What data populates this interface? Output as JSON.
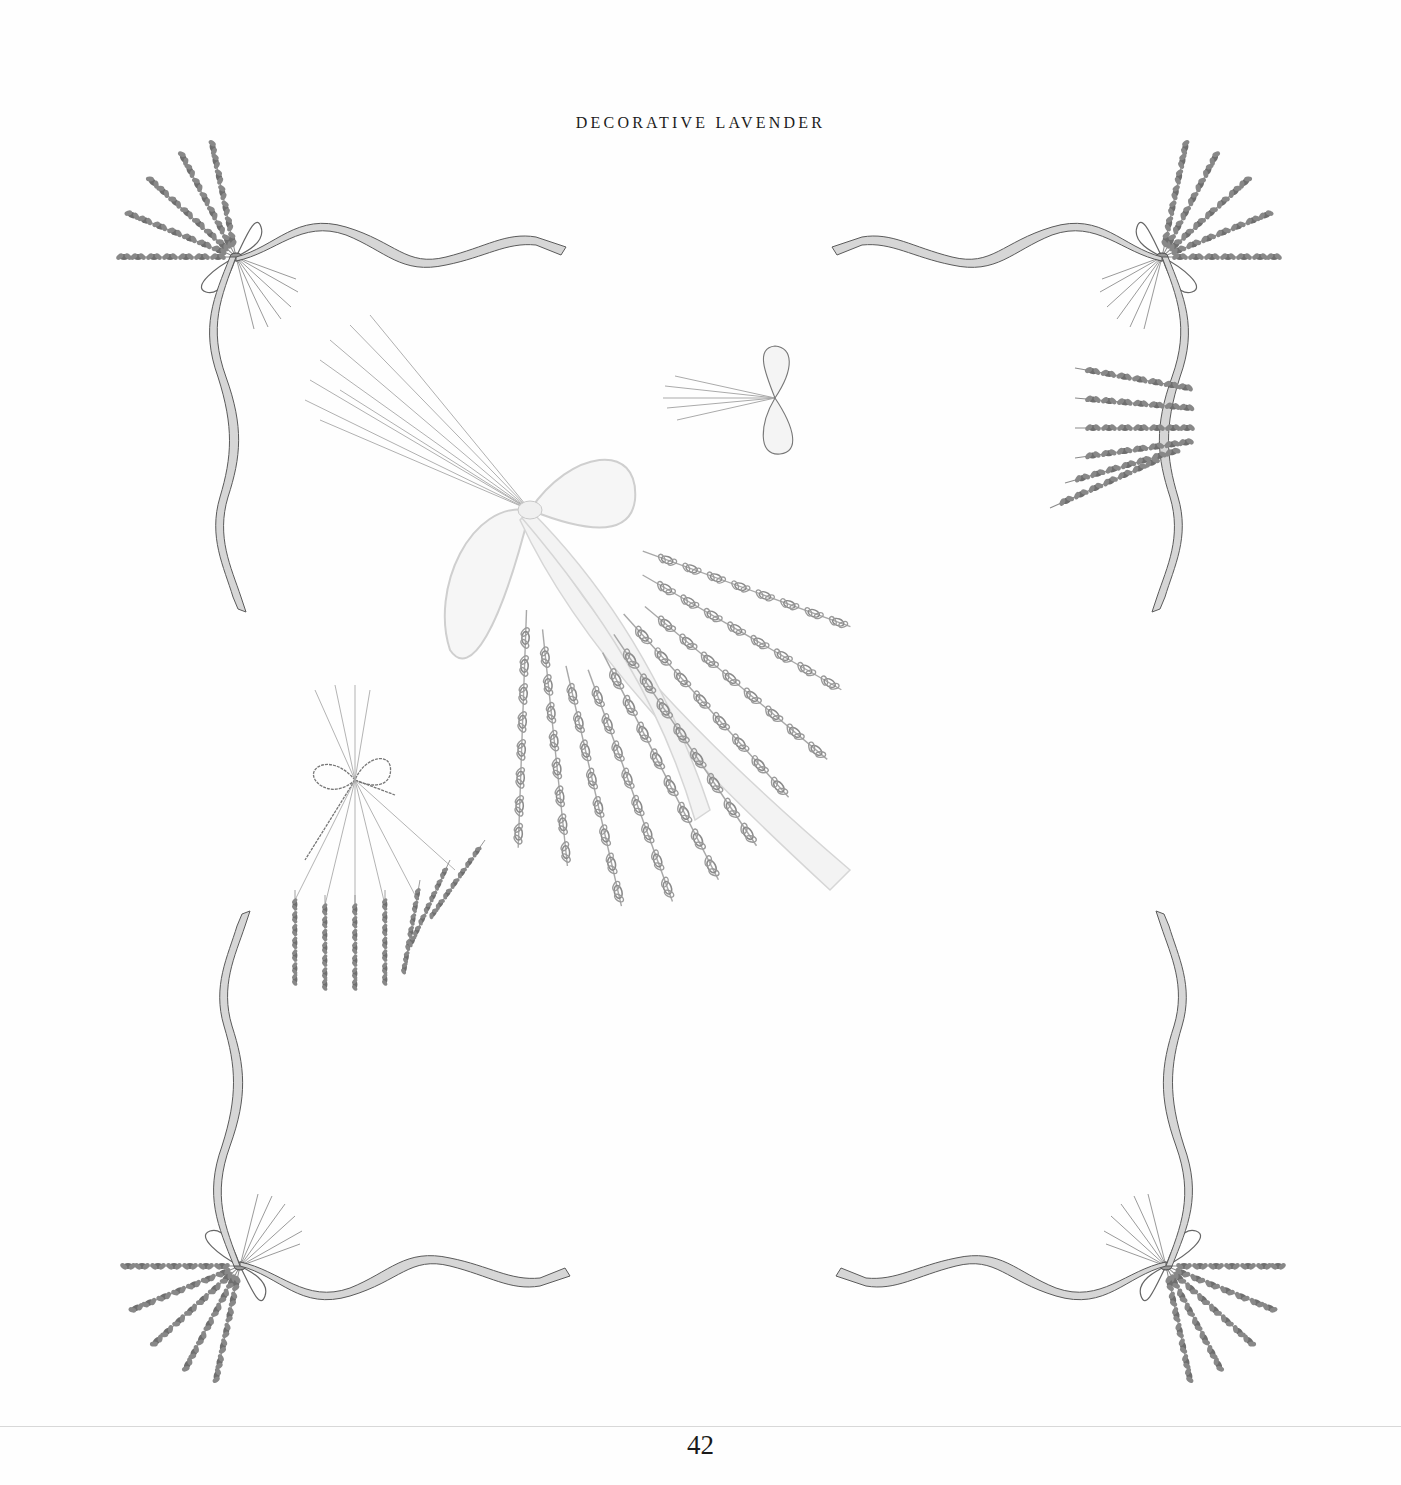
{
  "page": {
    "running_head": "DECORATIVE LAVENDER",
    "page_number": "42",
    "background": "#fefefe",
    "ink_color": "#555555"
  },
  "illustration": {
    "description": "Pencil drawings of lavender sprigs tied with ribbons",
    "elements": [
      {
        "name": "corner-spray-top-left",
        "subject": "lavender sprig bouquet with ribbon bow"
      },
      {
        "name": "corner-spray-top-right",
        "subject": "lavender sprig bouquet with ribbon bow"
      },
      {
        "name": "corner-spray-bottom-left",
        "subject": "lavender sprig bouquet with ribbon bow"
      },
      {
        "name": "corner-spray-bottom-right",
        "subject": "lavender sprig bouquet with ribbon bow"
      },
      {
        "name": "large-bundle-center",
        "subject": "large diagonal lavender bundle tied with wide ribbon"
      },
      {
        "name": "small-bundle-upper-right",
        "subject": "small lavender bunch with bow"
      },
      {
        "name": "small-bundle-left",
        "subject": "lavender bunch tied with twine"
      }
    ]
  }
}
